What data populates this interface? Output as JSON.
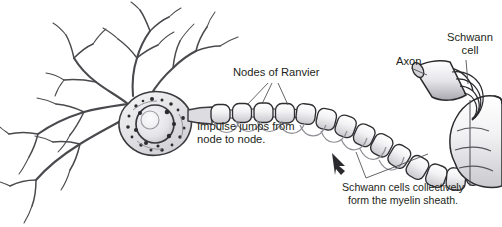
{
  "figure": {
    "name": "myelinated-neuron-diagram",
    "background_color": "#ffffff",
    "ink_color": "#231f20",
    "width": 502,
    "height": 227
  },
  "labels": {
    "nodes_of_ranvier": "Nodes of Ranvier",
    "impulse_line1": "Impulse jumps from",
    "impulse_line2": "node to node.",
    "axon": "Axon",
    "schwann_line1": "Schwann",
    "schwann_line2": "cell",
    "sheath_line1": "Schwann cells collectively",
    "sheath_line2": "form the myelin sheath."
  },
  "parts": {
    "dendrites": "dendrites",
    "soma": "cell-body",
    "nucleus": "nucleus",
    "axon_hillock": "axon-hillock",
    "myelin_segments": "myelin-sheath-segments",
    "nodes": "nodes-of-ranvier",
    "impulse_arcs": "saltatory-conduction-arcs",
    "impulse_arrow": "impulse-direction-arrow",
    "schwann_detail": "schwann-cell-wrapping-detail"
  },
  "colors": {
    "ink": "#231f20",
    "mid_gray": "#6f6f72",
    "light_gray": "#b9b9bc",
    "fill_gray": "#e9e9ec",
    "paper": "#ffffff"
  }
}
